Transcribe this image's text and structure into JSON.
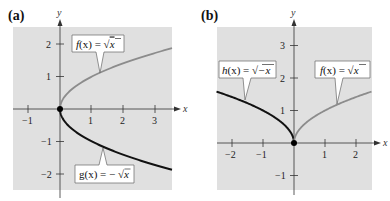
{
  "chart_data": [
    {
      "id": "a",
      "type": "line",
      "panel_label": "(a)",
      "title": "",
      "xlabel": "x",
      "ylabel": "y",
      "xlim": [
        -1.5,
        3.5
      ],
      "ylim": [
        -2.5,
        2.5
      ],
      "grid": false,
      "background": "#e0e0e0",
      "x_ticks": [
        -1,
        1,
        2,
        3
      ],
      "x_tick_labels": [
        "−1",
        "1",
        "2",
        "3"
      ],
      "y_ticks": [
        2,
        1,
        -1,
        -2
      ],
      "y_tick_labels": [
        "2",
        "1",
        "−1",
        "−2"
      ],
      "points": [
        {
          "x": 0,
          "y": 0,
          "label": "origin"
        }
      ],
      "series": [
        {
          "name": "f(x) = √x",
          "label_text": "f(x) = √x",
          "color": "#8c8c8c",
          "expr": "sqrt(x)",
          "domain": [
            0,
            3.5
          ],
          "sample": [
            {
              "x": 0,
              "y": 0
            },
            {
              "x": 1,
              "y": 1
            },
            {
              "x": 2,
              "y": 1.41
            },
            {
              "x": 3,
              "y": 1.73
            },
            {
              "x": 3.5,
              "y": 1.87
            }
          ]
        },
        {
          "name": "g(x) = −√x",
          "label_text": "g(x) = −√x",
          "color": "#111111",
          "expr": "-sqrt(x)",
          "domain": [
            0,
            3.5
          ],
          "sample": [
            {
              "x": 0,
              "y": 0
            },
            {
              "x": 1,
              "y": -1
            },
            {
              "x": 2,
              "y": -1.41
            },
            {
              "x": 3,
              "y": -1.73
            },
            {
              "x": 3.5,
              "y": -1.87
            }
          ]
        }
      ]
    },
    {
      "id": "b",
      "type": "line",
      "panel_label": "(b)",
      "title": "",
      "xlabel": "x",
      "ylabel": "y",
      "xlim": [
        -2.5,
        2.5
      ],
      "ylim": [
        -1.5,
        3.5
      ],
      "grid": false,
      "background": "#e0e0e0",
      "x_ticks": [
        -2,
        -1,
        1,
        2
      ],
      "x_tick_labels": [
        "−2",
        "−1",
        "1",
        "2"
      ],
      "y_ticks": [
        3,
        2,
        1,
        -1
      ],
      "y_tick_labels": [
        "3",
        "2",
        "1",
        "−1"
      ],
      "points": [
        {
          "x": 0,
          "y": 0,
          "label": "origin"
        }
      ],
      "series": [
        {
          "name": "h(x) = √−x",
          "label_text": "h(x) = √−x",
          "color": "#111111",
          "expr": "sqrt(-x)",
          "domain": [
            -2.5,
            0
          ],
          "sample": [
            {
              "x": -2.5,
              "y": 1.58
            },
            {
              "x": -2,
              "y": 1.41
            },
            {
              "x": -1,
              "y": 1
            },
            {
              "x": 0,
              "y": 0
            }
          ]
        },
        {
          "name": "f(x) = √x",
          "label_text": "f(x) = √x",
          "color": "#8c8c8c",
          "expr": "sqrt(x)",
          "domain": [
            0,
            2.5
          ],
          "sample": [
            {
              "x": 0,
              "y": 0
            },
            {
              "x": 1,
              "y": 1
            },
            {
              "x": 2,
              "y": 1.41
            },
            {
              "x": 2.5,
              "y": 1.58
            }
          ]
        }
      ]
    }
  ],
  "panels": {
    "a": {
      "label": "(a)",
      "x_axis_name": "x",
      "y_axis_name": "y",
      "x_ticks": [
        "−1",
        "1",
        "2",
        "3"
      ],
      "y_ticks": [
        "2",
        "1",
        "−1",
        "−2"
      ],
      "f_label": {
        "name": "f",
        "arg": "(x) = ",
        "rad": "x"
      },
      "g_label": {
        "name": "g",
        "arg": "(x) = − ",
        "rad": "x"
      }
    },
    "b": {
      "label": "(b)",
      "x_axis_name": "x",
      "y_axis_name": "y",
      "x_ticks": [
        "−2",
        "−1",
        "1",
        "2"
      ],
      "y_ticks": [
        "3",
        "2",
        "1",
        "−1"
      ],
      "h_label": {
        "name": "h",
        "arg": "(x) = ",
        "rad": "−x"
      },
      "f_label": {
        "name": "f",
        "arg": "(x) = ",
        "rad": "x"
      }
    }
  }
}
